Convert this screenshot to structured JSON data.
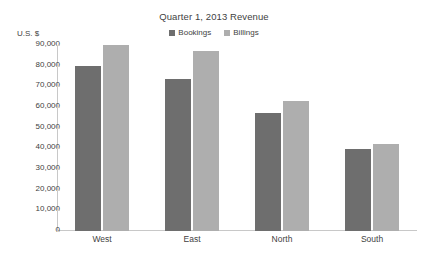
{
  "chart_data": {
    "type": "bar",
    "title": "Quarter 1, 2013 Revenue",
    "xlabel": "",
    "ylabel": "U.S. $",
    "categories": [
      "West",
      "East",
      "North",
      "South"
    ],
    "series": [
      {
        "name": "Bookings",
        "color": "#6e6e6e",
        "values": [
          80000,
          73500,
          57000,
          39500
        ]
      },
      {
        "name": "Billings",
        "color": "#aeaeae",
        "values": [
          90000,
          87000,
          63000,
          42000
        ]
      }
    ],
    "ylim": [
      0,
      90000
    ],
    "ytick_values": [
      0,
      10000,
      20000,
      30000,
      40000,
      50000,
      60000,
      70000,
      80000,
      90000
    ],
    "ytick_labels": [
      "0",
      "10,000",
      "20,000",
      "30,000",
      "40,000",
      "50,000",
      "60,000",
      "70,000",
      "80,000",
      "90,000"
    ],
    "grid": false,
    "legend_position": "top-center"
  }
}
